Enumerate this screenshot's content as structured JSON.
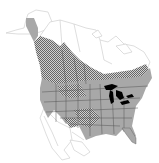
{
  "map": {
    "type": "species-range-map",
    "region": "North America",
    "colors": {
      "background": "#ffffff",
      "outline": "#c8c8c8",
      "year_round": "#a8a8a8",
      "breeding_hatch_dark": "#6a6a6a",
      "breeding_hatch_light": "#d8d8d8",
      "water": "#000000",
      "state_border": "#555555"
    },
    "legend": []
  }
}
